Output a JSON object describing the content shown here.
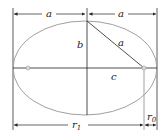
{
  "diagram": {
    "type": "ellipse-geometry",
    "labels": {
      "top_left_a": "a",
      "top_right_a": "a",
      "semi_minor": "b",
      "hypotenuse": "a",
      "focal_distance": "c",
      "r1_base": "r",
      "r1_sub": "1",
      "r0_base": "r",
      "r0_sub": "0"
    },
    "colors": {
      "ellipse": "#a0a0a0",
      "lines": "#222222",
      "focus": "#999999"
    }
  }
}
